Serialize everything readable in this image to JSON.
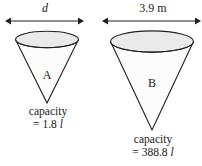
{
  "figure": {
    "background_color": "#ffffff",
    "stroke_color": "#231f20",
    "ellipse_fill_color": "#ebebeb",
    "cone_fill_color": "#fbfbfb"
  },
  "cone_a": {
    "letter": "A",
    "dimension_label": "d",
    "dimension_is_italic": true,
    "capacity_word": "capacity",
    "capacity_value": "= 1.8 ",
    "capacity_unit": "l",
    "capacity_full": "capacity = 1.8 l"
  },
  "cone_b": {
    "letter": "B",
    "dimension_label": "3.9 m",
    "dimension_is_italic": false,
    "capacity_word": "capacity",
    "capacity_value": "= 388.8 ",
    "capacity_unit": "l",
    "capacity_full": "capacity = 388.8 l"
  }
}
